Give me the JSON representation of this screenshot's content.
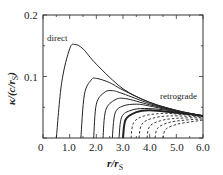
{
  "chart_data": {
    "type": "line",
    "title": "",
    "xlabel": "r/r_S",
    "ylabel": "κ/(c/r_S)",
    "xlim": [
      0,
      6.0
    ],
    "ylim": [
      0,
      0.2
    ],
    "x_ticks": [
      "0",
      "1.0",
      "2.0",
      "3.0",
      "4.0",
      "5.0",
      "6.0"
    ],
    "y_ticks": [
      "0.1",
      "0.2"
    ],
    "grid": false,
    "annotations": [
      "direct",
      "retrograde"
    ],
    "series": [
      {
        "name": "direct (a=+1)",
        "style": "solid",
        "x": [
          0.5,
          0.7,
          1.0,
          1.2,
          1.5,
          2.0,
          3.0,
          4.0,
          5.0,
          6.0
        ],
        "y": [
          0,
          0.09,
          0.145,
          0.152,
          0.145,
          0.12,
          0.08,
          0.058,
          0.045,
          0.036
        ]
      },
      {
        "name": "curve 2",
        "style": "solid",
        "x": [
          1.42,
          1.55,
          1.8,
          2.0,
          2.5,
          3.0,
          4.0,
          5.0,
          6.0
        ],
        "y": [
          0,
          0.07,
          0.094,
          0.097,
          0.09,
          0.078,
          0.058,
          0.045,
          0.036
        ]
      },
      {
        "name": "curve 3",
        "style": "solid",
        "x": [
          1.9,
          2.0,
          2.3,
          2.6,
          3.0,
          4.0,
          5.0,
          6.0
        ],
        "y": [
          0,
          0.055,
          0.074,
          0.077,
          0.072,
          0.056,
          0.044,
          0.036
        ]
      },
      {
        "name": "curve 4",
        "style": "solid",
        "x": [
          2.25,
          2.35,
          2.7,
          3.1,
          4.0,
          5.0,
          6.0
        ],
        "y": [
          0,
          0.045,
          0.062,
          0.064,
          0.054,
          0.044,
          0.036
        ]
      },
      {
        "name": "curve 5",
        "style": "solid",
        "x": [
          2.6,
          2.7,
          3.0,
          3.5,
          4.0,
          5.0,
          6.0
        ],
        "y": [
          0,
          0.04,
          0.052,
          0.055,
          0.052,
          0.043,
          0.036
        ]
      },
      {
        "name": "curve 6",
        "style": "solid",
        "x": [
          2.85,
          2.95,
          3.3,
          3.8,
          4.5,
          5.0,
          6.0
        ],
        "y": [
          0,
          0.034,
          0.045,
          0.048,
          0.046,
          0.042,
          0.036
        ]
      },
      {
        "name": "Schwarzschild (a=0)",
        "style": "solid-thick",
        "x": [
          3.0,
          3.1,
          3.5,
          4.0,
          5.0,
          6.0
        ],
        "y": [
          0,
          0.03,
          0.042,
          0.045,
          0.041,
          0.036
        ]
      },
      {
        "name": "retrograde 1",
        "style": "dashed",
        "x": [
          3.3,
          3.4,
          3.8,
          4.5,
          5.0,
          6.0
        ],
        "y": [
          0,
          0.025,
          0.036,
          0.04,
          0.039,
          0.035
        ]
      },
      {
        "name": "retrograde 2",
        "style": "dashed",
        "x": [
          3.6,
          3.7,
          4.1,
          4.8,
          6.0
        ],
        "y": [
          0,
          0.022,
          0.032,
          0.036,
          0.034
        ]
      },
      {
        "name": "retrograde 3",
        "style": "dashed",
        "x": [
          3.9,
          4.0,
          4.4,
          5.0,
          6.0
        ],
        "y": [
          0,
          0.019,
          0.028,
          0.032,
          0.033
        ]
      },
      {
        "name": "retrograde 4",
        "style": "dashed",
        "x": [
          4.2,
          4.3,
          4.7,
          5.3,
          6.0
        ],
        "y": [
          0,
          0.016,
          0.025,
          0.029,
          0.031
        ]
      },
      {
        "name": "retrograde 5",
        "style": "dashed",
        "x": [
          4.5,
          4.6,
          5.0,
          5.5,
          6.0
        ],
        "y": [
          0,
          0.014,
          0.022,
          0.026,
          0.029
        ]
      }
    ]
  },
  "labels": {
    "xlabel": "r/r",
    "xlabel_sub": "S",
    "ylabel": "κ/(c/r",
    "ylabel_sub": "S",
    "ylabel_end": ")",
    "direct": "direct",
    "retrograde": "retrograde",
    "x_ticks": [
      "0",
      "1.0",
      "2.0",
      "3.0",
      "4.0",
      "5.0",
      "6.0"
    ],
    "y_ticks": [
      "0.1",
      "0.2"
    ]
  }
}
